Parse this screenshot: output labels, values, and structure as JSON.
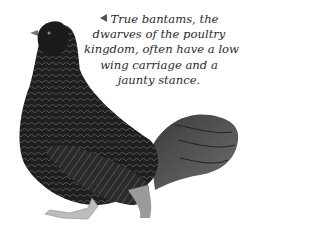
{
  "image": {
    "subject": "bantam-chicken",
    "description": "Dark laced bantam hen standing, facing left, with full fanned tail"
  },
  "caption": {
    "pointer_icon": "left-triangle-icon",
    "lines": [
      "True bantams, the",
      "dwarves of the poultry",
      "kingdom, often have a low",
      "wing carriage and a",
      "jaunty stance."
    ]
  },
  "colors": {
    "background": "#ffffff",
    "plumage_dark": "#1c1c1c",
    "plumage_lace": "#5a5a5a",
    "caption_text": "#2a2a2a"
  }
}
